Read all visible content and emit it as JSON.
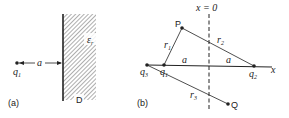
{
  "panel_a": {
    "label": "(a)",
    "charge": "q",
    "charge_sub": "1",
    "distance": "a",
    "permittivity": "ε",
    "permittivity_sub": "r",
    "region": "D"
  },
  "panel_b": {
    "label": "(b)",
    "plane": "x = 0",
    "axis": "x",
    "point_p": "P",
    "point_q": "Q",
    "q1": "q",
    "q1_sub": "1",
    "q2": "q",
    "q2_sub": "2",
    "q3": "q",
    "q3_sub": "3",
    "r1": "r",
    "r1_sub": "1",
    "r2": "r",
    "r2_sub": "2",
    "r3": "r",
    "r3_sub": "3",
    "a_left": "a",
    "a_right": "a"
  },
  "colors": {
    "ink": "#222222",
    "hatch": "#777777"
  }
}
